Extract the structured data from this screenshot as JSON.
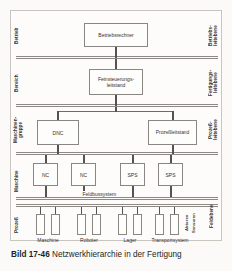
{
  "figure": {
    "caption_label": "Bild 17-46",
    "caption_text": "Netzwerkhierarchie in der Fertigung"
  },
  "left_labels": [
    {
      "key": "betrieb",
      "text": "Betrieb"
    },
    {
      "key": "bereich",
      "text": "Bereich"
    },
    {
      "key": "maschinengruppe",
      "text": "Maschinen-\ngruppe"
    },
    {
      "key": "maschine",
      "text": "Maschine"
    },
    {
      "key": "prozess",
      "text": "Prozeß"
    }
  ],
  "right_labels": [
    {
      "key": "betriebsleitebene",
      "text": "Betriebs-\nleitebene"
    },
    {
      "key": "fertigungsleitebene",
      "text": "Fertigungs-\nleitebene"
    },
    {
      "key": "prozessleitebene",
      "text": "Prozeß-\nleitebene"
    },
    {
      "key": "feldebene",
      "text": "Feldebene"
    }
  ],
  "nodes": {
    "betriebsrechner": "Betriebsrechner",
    "feinsteuerungsleitstand": "Feinsteuerungs-\nleitstand",
    "dnc": "DNC",
    "prozessleitstand": "Prozeßleitstand",
    "nc_1": "NC",
    "nc_2": "NC",
    "sps_1": "SPS",
    "sps_2": "SPS"
  },
  "fieldbus": {
    "label": "Feldbussystem"
  },
  "io_label": {
    "aktoren": "Aktoren",
    "sensoren": "Sensoren"
  },
  "process_groups": [
    {
      "key": "maschine",
      "label": "Maschine"
    },
    {
      "key": "roboter",
      "label": "Roboter"
    },
    {
      "key": "lager",
      "label": "Lager"
    },
    {
      "key": "transportsystem",
      "label": "Transportsystem"
    }
  ],
  "colors": {
    "frame": "#c9c6c0",
    "rule": "#8d8a85",
    "box_border": "#8a8782",
    "connector": "#55534f",
    "page_background": "#fbfaf8",
    "text": "#33322f"
  }
}
